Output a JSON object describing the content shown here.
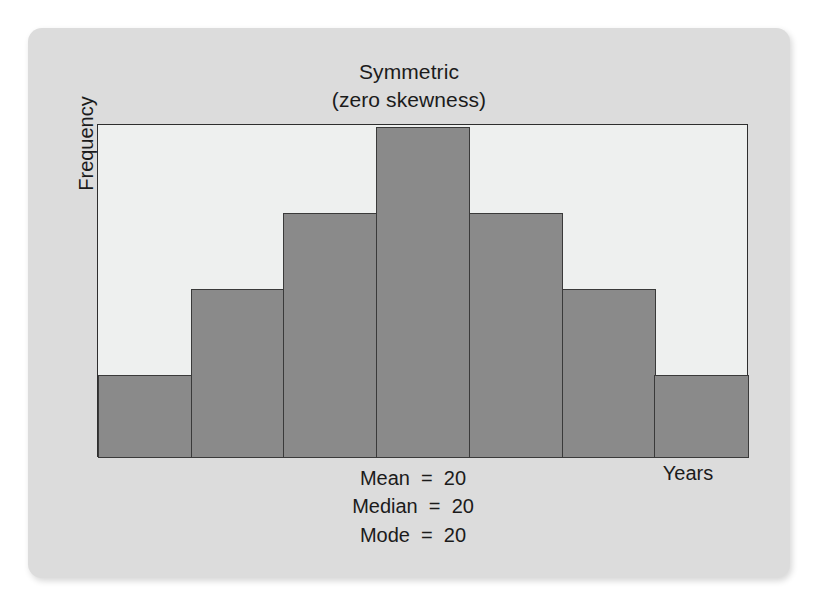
{
  "chart_data": {
    "type": "bar",
    "title_line1": "Symmetric",
    "title_line2": "(zero skewness)",
    "xlabel": "Years",
    "ylabel": "Frequency",
    "grid": false,
    "legend": "none",
    "categories": [
      "1",
      "2",
      "3",
      "4",
      "5",
      "6",
      "7"
    ],
    "values": [
      25,
      51,
      74,
      100,
      74,
      51,
      25
    ],
    "ylim": [
      0,
      100
    ],
    "bar_fill_color": "#8a8a8a",
    "bar_border_color": "#3a3a3a",
    "plot_background_color": "#eef0ef",
    "card_background_color": "#dcdcdc",
    "annotations": [
      "Mean  =  20",
      "Median  =  20",
      "Mode  =  20"
    ],
    "annotation_mean": "Mean  =  20",
    "annotation_median": "Median  =  20",
    "annotation_mode": "Mode  =  20"
  }
}
